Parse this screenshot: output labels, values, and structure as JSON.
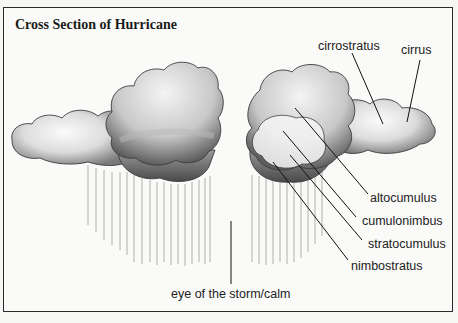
{
  "title": "Cross Section of Hurricane",
  "labels": {
    "cirrostratus": "cirrostratus",
    "cirrus": "cirrus",
    "altocumulus": "altocumulus",
    "cumulonimbus": "cumulonimbus",
    "stratocumulus": "stratocumulus",
    "nimbostratus": "nimbostratus",
    "eye": "eye of the storm/calm"
  },
  "colors": {
    "border": "#2a2a2a",
    "text": "#222222",
    "cloud_dark": "#6e6e6e",
    "cloud_light": "#f2f2f2",
    "rain": "#9a9a9a"
  }
}
